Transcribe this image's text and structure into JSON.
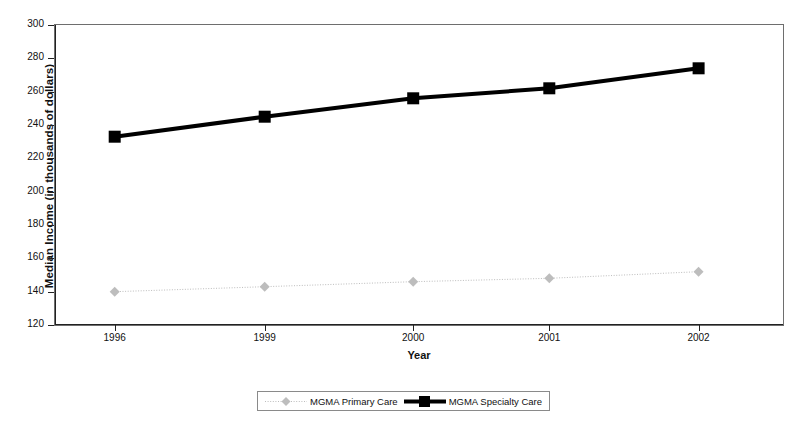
{
  "chart_data": {
    "type": "line",
    "title": "",
    "xlabel": "Year",
    "ylabel": "Median Income (in thousands of dollars)",
    "categories": [
      "1996",
      "1999",
      "2000",
      "2001",
      "2002"
    ],
    "x_tick_labels": [
      "1996",
      "1999",
      "2000",
      "2001",
      "2002"
    ],
    "y_tick_labels": [
      "300",
      "280",
      "260",
      "240",
      "220",
      "200",
      "180",
      "160",
      "140",
      "120"
    ],
    "y_tick_values": [
      300,
      280,
      260,
      240,
      220,
      200,
      180,
      160,
      140,
      120
    ],
    "ylim": [
      120,
      300
    ],
    "grid": false,
    "legend_position": "bottom",
    "series": [
      {
        "name": "MGMA Primary Care",
        "values": [
          140,
          143,
          146,
          148,
          152
        ],
        "color": "#bdbdbd",
        "marker": "diamond",
        "line_style": "dotted",
        "line_width": 1
      },
      {
        "name": "MGMA Specialty Care",
        "values": [
          233,
          245,
          256,
          262,
          274
        ],
        "color": "#000000",
        "marker": "square",
        "line_style": "solid",
        "line_width": 4
      }
    ]
  },
  "legend": {
    "entries": [
      {
        "label": "MGMA Primary Care"
      },
      {
        "label": "MGMA Specialty Care"
      }
    ]
  },
  "axes": {
    "x_title": "Year",
    "y_title": "Median Income (in thousands of dollars)"
  }
}
